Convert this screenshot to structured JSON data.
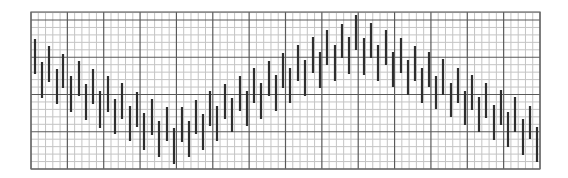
{
  "chart_data": {
    "type": "bar",
    "subtype": "range-bar (high-low) on grid paper",
    "title": "",
    "xlabel": "",
    "ylabel": "",
    "grid": true,
    "legend": null,
    "plot_area_px": {
      "left": 31,
      "top": 12,
      "right": 540,
      "bottom": 169
    },
    "grid_spec": {
      "major_x_divisions": 14,
      "minor_per_major_x": 5,
      "major_y_lines_px": [
        20,
        57,
        95,
        132,
        169
      ],
      "minor_per_major_y": 5,
      "colors": {
        "minor": "#c4c4c4",
        "major": "#5a5a5a",
        "bar": "#2e2e2e"
      }
    },
    "units_note": "Values in grid minor-units above plot bottom (1 unit = one minor row ≈ 7.4px; 5 units per major row).",
    "ylim": [
      0,
      21
    ],
    "x": [
      1,
      2,
      3,
      4,
      5,
      6,
      7,
      8,
      9,
      10,
      11,
      12,
      13,
      14,
      15,
      16,
      17,
      18,
      19,
      20,
      21,
      22,
      23,
      24,
      25,
      26,
      27,
      28,
      29,
      30,
      31,
      32,
      33,
      34,
      35,
      36,
      37,
      38,
      39,
      40,
      41,
      42,
      43,
      44,
      45,
      46,
      47,
      48,
      49,
      50,
      51,
      52,
      53,
      54,
      55,
      56,
      57,
      58,
      59,
      60,
      61,
      62,
      63,
      64,
      65,
      66,
      67,
      68,
      69,
      70
    ],
    "bars_px": [
      {
        "x": 35,
        "top": 39,
        "bottom": 74
      },
      {
        "x": 42,
        "top": 62,
        "bottom": 98
      },
      {
        "x": 49,
        "top": 46,
        "bottom": 82
      },
      {
        "x": 57,
        "top": 69,
        "bottom": 104
      },
      {
        "x": 63,
        "top": 54,
        "bottom": 88
      },
      {
        "x": 71,
        "top": 76,
        "bottom": 112
      },
      {
        "x": 79,
        "top": 61,
        "bottom": 96
      },
      {
        "x": 86,
        "top": 84,
        "bottom": 120
      },
      {
        "x": 93,
        "top": 69,
        "bottom": 104
      },
      {
        "x": 100,
        "top": 91,
        "bottom": 128
      },
      {
        "x": 108,
        "top": 76,
        "bottom": 112
      },
      {
        "x": 115,
        "top": 99,
        "bottom": 134
      },
      {
        "x": 122,
        "top": 83,
        "bottom": 119
      },
      {
        "x": 130,
        "top": 106,
        "bottom": 141
      },
      {
        "x": 137,
        "top": 92,
        "bottom": 127
      },
      {
        "x": 144,
        "top": 113,
        "bottom": 150
      },
      {
        "x": 152,
        "top": 99,
        "bottom": 135
      },
      {
        "x": 159,
        "top": 121,
        "bottom": 157
      },
      {
        "x": 167,
        "top": 107,
        "bottom": 141
      },
      {
        "x": 174,
        "top": 128,
        "bottom": 164
      },
      {
        "x": 182,
        "top": 107,
        "bottom": 142
      },
      {
        "x": 189,
        "top": 121,
        "bottom": 157
      },
      {
        "x": 196,
        "top": 100,
        "bottom": 134
      },
      {
        "x": 203,
        "top": 114,
        "bottom": 150
      },
      {
        "x": 210,
        "top": 91,
        "bottom": 126
      },
      {
        "x": 217,
        "top": 106,
        "bottom": 141
      },
      {
        "x": 225,
        "top": 84,
        "bottom": 119
      },
      {
        "x": 232,
        "top": 98,
        "bottom": 132
      },
      {
        "x": 240,
        "top": 76,
        "bottom": 111
      },
      {
        "x": 247,
        "top": 91,
        "bottom": 126
      },
      {
        "x": 254,
        "top": 68,
        "bottom": 103
      },
      {
        "x": 261,
        "top": 83,
        "bottom": 119
      },
      {
        "x": 269,
        "top": 61,
        "bottom": 96
      },
      {
        "x": 276,
        "top": 75,
        "bottom": 111
      },
      {
        "x": 283,
        "top": 53,
        "bottom": 88
      },
      {
        "x": 290,
        "top": 68,
        "bottom": 103
      },
      {
        "x": 298,
        "top": 45,
        "bottom": 81
      },
      {
        "x": 305,
        "top": 60,
        "bottom": 96
      },
      {
        "x": 313,
        "top": 37,
        "bottom": 73
      },
      {
        "x": 320,
        "top": 52,
        "bottom": 88
      },
      {
        "x": 327,
        "top": 30,
        "bottom": 65
      },
      {
        "x": 335,
        "top": 45,
        "bottom": 81
      },
      {
        "x": 342,
        "top": 24,
        "bottom": 58
      },
      {
        "x": 349,
        "top": 37,
        "bottom": 74
      },
      {
        "x": 356,
        "top": 15,
        "bottom": 50
      },
      {
        "x": 364,
        "top": 38,
        "bottom": 75
      },
      {
        "x": 371,
        "top": 23,
        "bottom": 58
      },
      {
        "x": 378,
        "top": 45,
        "bottom": 81
      },
      {
        "x": 386,
        "top": 30,
        "bottom": 65
      },
      {
        "x": 393,
        "top": 52,
        "bottom": 87
      },
      {
        "x": 401,
        "top": 38,
        "bottom": 73
      },
      {
        "x": 408,
        "top": 60,
        "bottom": 95
      },
      {
        "x": 415,
        "top": 46,
        "bottom": 81
      },
      {
        "x": 422,
        "top": 68,
        "bottom": 103
      },
      {
        "x": 429,
        "top": 52,
        "bottom": 87
      },
      {
        "x": 436,
        "top": 76,
        "bottom": 109
      },
      {
        "x": 443,
        "top": 59,
        "bottom": 95
      },
      {
        "x": 451,
        "top": 83,
        "bottom": 117
      },
      {
        "x": 458,
        "top": 68,
        "bottom": 103
      },
      {
        "x": 465,
        "top": 91,
        "bottom": 125
      },
      {
        "x": 472,
        "top": 75,
        "bottom": 110
      },
      {
        "x": 479,
        "top": 97,
        "bottom": 132
      },
      {
        "x": 486,
        "top": 83,
        "bottom": 118
      },
      {
        "x": 494,
        "top": 105,
        "bottom": 140
      },
      {
        "x": 501,
        "top": 90,
        "bottom": 125
      },
      {
        "x": 508,
        "top": 112,
        "bottom": 147
      },
      {
        "x": 515,
        "top": 97,
        "bottom": 132
      },
      {
        "x": 523,
        "top": 119,
        "bottom": 155
      },
      {
        "x": 530,
        "top": 106,
        "bottom": 139
      },
      {
        "x": 537,
        "top": 127,
        "bottom": 162
      }
    ],
    "series": [
      {
        "name": "high",
        "values": [
          17.5,
          14.4,
          16.6,
          13.5,
          15.5,
          12.5,
          14.5,
          11.4,
          13.5,
          10.4,
          12.5,
          9.4,
          11.6,
          8.5,
          10.2,
          7.5,
          9.4,
          6.5,
          8.3,
          5.5,
          8.3,
          6.5,
          9.3,
          7.4,
          10.4,
          8.5,
          11.4,
          9.6,
          12.5,
          10.4,
          13.6,
          11.6,
          14.5,
          12.7,
          15.6,
          13.6,
          16.7,
          14.7,
          17.8,
          15.8,
          18.7,
          16.7,
          19.5,
          17.8,
          20.7,
          17.6,
          19.7,
          16.7,
          18.7,
          15.8,
          17.6,
          14.7,
          16.6,
          13.6,
          15.8,
          12.5,
          14.8,
          11.6,
          13.6,
          10.4,
          12.7,
          9.6,
          11.6,
          8.6,
          10.6,
          7.6,
          9.6,
          6.7,
          8.5,
          5.7
        ],
        "low": [
          12.8,
          9.6,
          11.8,
          8.8,
          10.9,
          7.7,
          9.8,
          6.6,
          8.8,
          5.5,
          7.7,
          4.7,
          6.7,
          3.8,
          5.7,
          2.6,
          4.5,
          1.6,
          3.8,
          0.7,
          3.6,
          1.6,
          4.7,
          2.6,
          5.8,
          3.8,
          6.7,
          4.9,
          7.7,
          5.8,
          8.9,
          6.7,
          9.8,
          7.7,
          10.9,
          8.9,
          11.8,
          9.8,
          12.9,
          10.9,
          13.9,
          11.8,
          14.9,
          12.8,
          15.9,
          12.7,
          14.9,
          11.8,
          14.0,
          11.0,
          12.9,
          9.8,
          11.8,
          8.9,
          11.0,
          8.1,
          9.8,
          7.0,
          8.9,
          5.9,
          7.9,
          5.0,
          6.8,
          3.9,
          5.9,
          2.9,
          5.0,
          1.9,
          4.0,
          0.9
        ]
      }
    ]
  }
}
